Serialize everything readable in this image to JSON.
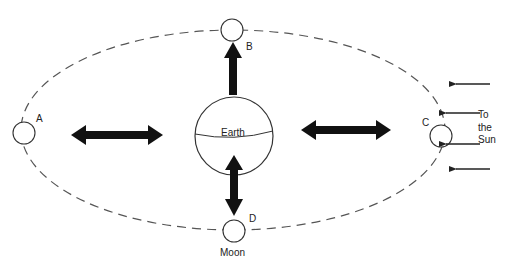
{
  "diagram": {
    "central_body": {
      "label": "Earth"
    },
    "moon_positions": [
      {
        "id": "A",
        "label": "A"
      },
      {
        "id": "B",
        "label": "B"
      },
      {
        "id": "C",
        "label": "C"
      },
      {
        "id": "D",
        "label": "D"
      }
    ],
    "moon_label": "Moon",
    "sun_direction": {
      "line1": "To",
      "line2": "the",
      "line3": "Sun"
    },
    "colors": {
      "line": "#222222",
      "orbit": "#555555",
      "background": "#ffffff"
    }
  }
}
